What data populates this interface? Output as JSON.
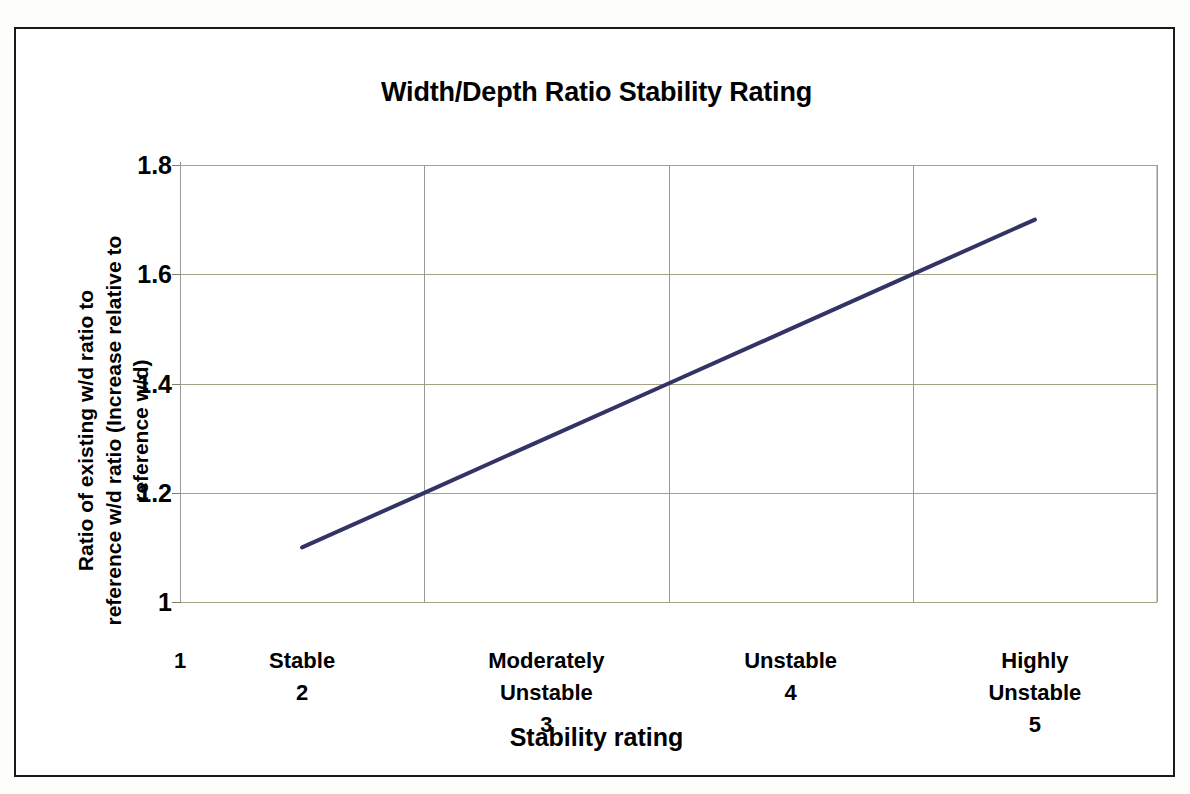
{
  "chart_data": {
    "type": "line",
    "title": "Width/Depth Ratio Stability Rating",
    "xlabel": "Stability rating",
    "ylabel": "Ratio of existing w/d ratio to\nreference w/d ratio (Increase relative\nto reference w/d)",
    "ylim": [
      1,
      1.8
    ],
    "xlim": [
      1,
      5
    ],
    "yticks": [
      "1",
      "1.2",
      "1.4",
      "1.6",
      "1.8"
    ],
    "ytick_values": [
      1,
      1.2,
      1.4,
      1.6,
      1.8
    ],
    "xtick_values": [
      1,
      2,
      3,
      4,
      5
    ],
    "categories": [
      "1",
      "Stable\n2",
      "Moderately\nUnstable\n3",
      "Unstable\n4",
      "Highly Unstable\n5"
    ],
    "category_names": [
      "",
      "Stable",
      "Moderately Unstable",
      "Unstable",
      "Highly Unstable"
    ],
    "category_numbers": [
      "1",
      "2",
      "3",
      "4",
      "5"
    ],
    "grid": true,
    "legend": "none",
    "series": [
      {
        "name": "w/d ratio",
        "color": "#333366",
        "x": [
          1.5,
          2.0,
          2.5,
          3.0,
          3.5,
          4.0,
          4.5
        ],
        "values": [
          1.1,
          1.2,
          1.3,
          1.4,
          1.5,
          1.6,
          1.7
        ]
      }
    ]
  },
  "chart": {
    "title": "Width/Depth Ratio Stability Rating",
    "y_axis_title": "Ratio of existing w/d ratio to\nreference w/d ratio (Increase relative to reference w/d)",
    "x_axis_title": "Stability rating",
    "y_ticks": [
      {
        "label": "1.8",
        "value": 1.8
      },
      {
        "label": "1.6",
        "value": 1.6
      },
      {
        "label": "1.4",
        "value": 1.4
      },
      {
        "label": "1.2",
        "value": 1.2
      },
      {
        "label": "1",
        "value": 1
      }
    ],
    "x_categories": [
      {
        "name": "",
        "number": "1",
        "value": 1
      },
      {
        "name": "Stable",
        "number": "2",
        "value": 2
      },
      {
        "name": "Moderately Unstable",
        "number": "3",
        "value": 3
      },
      {
        "name": "Unstable",
        "number": "4",
        "value": 4
      },
      {
        "name": "Highly Unstable",
        "number": "5",
        "value": 5
      }
    ],
    "colors": {
      "series_line": "#333366",
      "horizontal_gridline": "#a3a383",
      "vertical_gridline": "#9a9a9a",
      "frame_border": "#1a1a1a",
      "background": "#ffffff",
      "text": "#000000"
    }
  }
}
